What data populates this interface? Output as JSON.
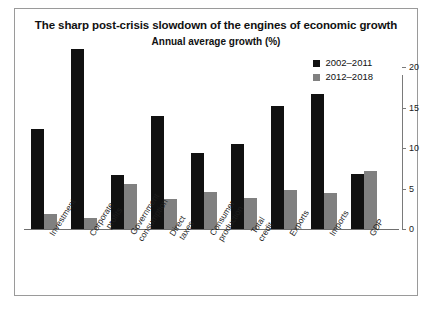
{
  "chart_data": {
    "type": "bar",
    "title": "The sharp post-crisis slowdown of the engines of economic growth",
    "subtitle": "Annual average growth (%)",
    "xlabel": "",
    "ylabel": "",
    "ylim": [
      0,
      20
    ],
    "yticks": [
      0,
      5,
      10,
      15,
      20
    ],
    "ytick_labels": [
      "0",
      "5",
      "10",
      "15",
      "20"
    ],
    "grid": false,
    "legend_position": "top-right",
    "categories": [
      "Investment",
      "Corporate profits",
      "Government consumption",
      "Direct taxes",
      "Consumer production",
      "Total credit",
      "Exports",
      "Imports",
      "GDP"
    ],
    "series": [
      {
        "name": "2002–2011",
        "color": "#111111",
        "values": [
          12.3,
          22.2,
          6.7,
          14.0,
          9.4,
          10.5,
          15.2,
          16.7,
          6.8
        ]
      },
      {
        "name": "2012–2018",
        "color": "#808080",
        "values": [
          1.8,
          1.3,
          5.5,
          3.7,
          4.6,
          3.8,
          4.8,
          4.4,
          7.2
        ]
      }
    ]
  },
  "axis": {
    "y_label_0": "0",
    "y_label_5": "5",
    "y_label_10": "10",
    "y_label_15": "15",
    "y_label_20": "20"
  },
  "legend": {
    "items": [
      {
        "label": "2002–2011",
        "color": "#111111"
      },
      {
        "label": "2012–2018",
        "color": "#808080"
      }
    ]
  }
}
